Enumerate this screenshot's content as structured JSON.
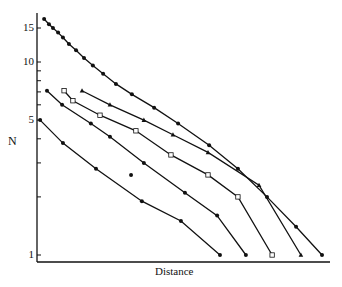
{
  "chart_data": {
    "type": "line",
    "title": "",
    "xlabel": "Distance",
    "ylabel": "N",
    "yscale": "log",
    "ylim": [
      1,
      17
    ],
    "xlim": [
      0,
      100
    ],
    "yticks_labeled": [
      "15",
      "10",
      "5",
      "1"
    ],
    "ytick_values": [
      15,
      10,
      5,
      1
    ],
    "minor_yticks": [
      9,
      8,
      7,
      6,
      4,
      3,
      2
    ],
    "grid": false,
    "legend": null,
    "series": [
      {
        "name": "curve-1",
        "marker": "filled-dot",
        "x": [
          2.5,
          4.2,
          5.6,
          7.4,
          9.1,
          11.2,
          13.7,
          16.5,
          19.6,
          23.2,
          27.7,
          33.3,
          41.1,
          49.5,
          60.4,
          70.5,
          80.7,
          90.9,
          100
        ],
        "y": [
          16.7,
          15.7,
          15.0,
          14.2,
          13.4,
          12.4,
          11.5,
          10.5,
          9.6,
          8.7,
          7.7,
          6.8,
          5.8,
          4.8,
          3.7,
          2.8,
          2.0,
          1.4,
          1.0
        ]
      },
      {
        "name": "curve-2",
        "marker": "triangle",
        "x": [
          15.8,
          25.6,
          37.5,
          47.7,
          60.0,
          77.9,
          92.6
        ],
        "y": [
          7.1,
          6.0,
          5.0,
          4.2,
          3.4,
          2.3,
          1.0
        ]
      },
      {
        "name": "curve-3",
        "marker": "open-square",
        "x": [
          9.5,
          12.6,
          22.1,
          34.7,
          47.0,
          60.0,
          70.5,
          82.5
        ],
        "y": [
          7.1,
          6.3,
          5.3,
          4.4,
          3.3,
          2.6,
          2.0,
          1.0
        ]
      },
      {
        "name": "curve-4",
        "marker": "filled-dot",
        "x": [
          3.5,
          8.8,
          18.9,
          25.6,
          37.5,
          51.9,
          63.2,
          73.3
        ],
        "y": [
          7.1,
          6.0,
          4.8,
          4.1,
          3.0,
          2.1,
          1.6,
          1.0
        ]
      },
      {
        "name": "curve-5",
        "marker": "filled-dot",
        "x": [
          1.1,
          9.1,
          20.7,
          36.8,
          50.5,
          64.2
        ],
        "y": [
          5.0,
          3.8,
          2.8,
          1.9,
          1.5,
          1.0
        ]
      }
    ],
    "annotations": [
      {
        "type": "outlier-point",
        "marker": "filled-dot",
        "x": 33.0,
        "y": 2.6
      }
    ]
  },
  "axis": {
    "y_label": "N",
    "x_label": "Distance",
    "ticks": [
      {
        "label": "15",
        "value": 15
      },
      {
        "label": "10",
        "value": 10
      },
      {
        "label": "5",
        "value": 5
      },
      {
        "label": "1",
        "value": 1
      }
    ]
  }
}
